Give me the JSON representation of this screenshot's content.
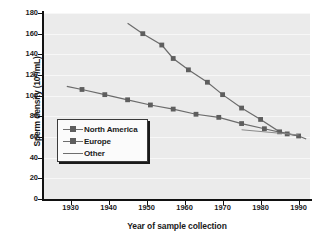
{
  "chart_data": {
    "type": "line",
    "title": "",
    "subtitle": "",
    "xlabel": "Year of sample collection",
    "ylabel": "Sperm density (10⁶/mL)",
    "ylabel_base": "Sperm density (10",
    "ylabel_exp": "6",
    "ylabel_tail": "/mL)",
    "xlim": [
      1923,
      1993
    ],
    "ylim": [
      0,
      180
    ],
    "grid": "horizontal-faint",
    "legend_position": "inner-lower-left",
    "y_ticks": [
      0,
      20,
      40,
      60,
      80,
      100,
      120,
      140,
      160,
      180
    ],
    "x_ticks": [
      1930,
      1940,
      1950,
      1960,
      1970,
      1980,
      1990
    ],
    "series": [
      {
        "name": "North America",
        "marker": "square",
        "color": "#6b6b6b",
        "x": [
          1929,
          1933,
          1939,
          1945,
          1951,
          1957,
          1963,
          1969,
          1975,
          1981,
          1987,
          1990
        ],
        "values": [
          109,
          106,
          101,
          96,
          91,
          87,
          82,
          79,
          73,
          68,
          63,
          61
        ]
      },
      {
        "name": "Europe",
        "marker": "square",
        "color": "#6b6b6b",
        "x": [
          1945,
          1949,
          1954,
          1957,
          1961,
          1966,
          1970,
          1975,
          1980,
          1985,
          1990,
          1992
        ],
        "values": [
          170,
          160,
          149,
          136,
          125,
          113,
          101,
          88,
          77,
          65,
          61,
          58
        ]
      },
      {
        "name": "Other",
        "marker": "none",
        "color": "#8a8a8a",
        "x": [
          1975,
          1990
        ],
        "values": [
          67,
          62
        ]
      }
    ]
  },
  "legend": {
    "items": [
      {
        "label": "North America",
        "key": "line-square-marker"
      },
      {
        "label": "Europe",
        "key": "line-square-marker"
      },
      {
        "label": "Other",
        "key": "plain-line"
      }
    ]
  },
  "colors": {
    "plot_background": "#ebebeb",
    "axis": "#111111",
    "gridline": "#f7f7f7",
    "series_line": "#6b6b6b",
    "marker": "#5e5e5e",
    "text": "#1a1a1a"
  }
}
